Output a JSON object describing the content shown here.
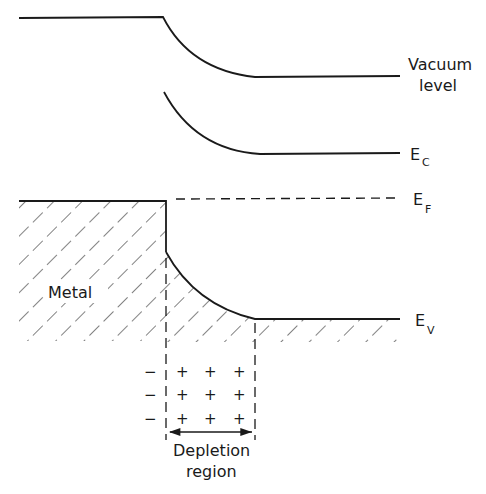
{
  "diagram": {
    "labels": {
      "vacuum_line1": "Vacuum",
      "vacuum_line2": "level",
      "ec_main": "E",
      "ec_sub": "C",
      "ef_main": "E",
      "ef_sub": "F",
      "ev_main": "E",
      "ev_sub": "V",
      "metal": "Metal",
      "depletion_line1": "Depletion",
      "depletion_line2": "region"
    },
    "charges": {
      "negative": [
        "−",
        "−",
        "−"
      ],
      "positive_rows": [
        [
          "+",
          "+",
          "+"
        ],
        [
          "+",
          "+",
          "+"
        ],
        [
          "+",
          "+",
          "+"
        ]
      ]
    },
    "colors": {
      "ink": "#1a1a1a",
      "background": "#ffffff"
    }
  }
}
